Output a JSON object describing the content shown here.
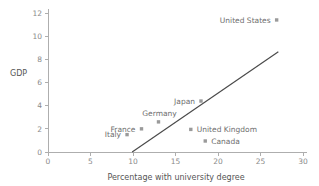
{
  "chart_data": {
    "type": "scatter",
    "title": "",
    "xlabel": "Percentage with university degree",
    "ylabel": "GDP",
    "xlim": [
      0,
      30
    ],
    "ylim": [
      0,
      12
    ],
    "xticks": [
      0,
      5,
      10,
      15,
      20,
      25,
      30
    ],
    "yticks": [
      0,
      2,
      4,
      6,
      8,
      10,
      12
    ],
    "xticklabels": [
      "0",
      "5",
      "10",
      "15",
      "20",
      "25",
      "30"
    ],
    "yticklabels": [
      "0",
      "2",
      "4",
      "6",
      "8",
      "10",
      "12"
    ],
    "grid": false,
    "legend": false,
    "marker_color": "#9a9a9a",
    "line_color": "#4a4a4a",
    "axis_color": "#aeaeae",
    "points": [
      {
        "label": "United States",
        "x": 26.9,
        "y": 11.4,
        "label_side": "left"
      },
      {
        "label": "Japan",
        "x": 18.0,
        "y": 4.4,
        "label_side": "left"
      },
      {
        "label": "Germany",
        "x": 13.0,
        "y": 2.6,
        "label_side": "above-left"
      },
      {
        "label": "France",
        "x": 11.0,
        "y": 2.0,
        "label_side": "left"
      },
      {
        "label": "Italy",
        "x": 9.3,
        "y": 1.5,
        "label_side": "left"
      },
      {
        "label": "United Kingdom",
        "x": 16.8,
        "y": 1.95,
        "label_side": "right"
      },
      {
        "label": "Canada",
        "x": 18.5,
        "y": 0.95,
        "label_side": "right"
      }
    ],
    "trend_line": {
      "x0": 9.9,
      "y0": 0.0,
      "x1": 27.1,
      "y1": 8.65
    }
  }
}
